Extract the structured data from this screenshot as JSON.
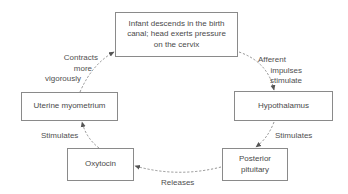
{
  "diagram": {
    "type": "cycle-flow",
    "nodes": {
      "stimulus": {
        "line1": "Infant descends in the birth",
        "line2": "canal; head exerts pressure",
        "line3": "on the cervix"
      },
      "hypothalamus": {
        "label": "Hypothalamus"
      },
      "pituitary": {
        "line1": "Posterior",
        "line2": "pituitary"
      },
      "oxytocin": {
        "label": "Oxytocin"
      },
      "uterus": {
        "label": "Uterine myometrium"
      }
    },
    "edges": {
      "afferent": {
        "line1": "Afferent",
        "line2": "impulses",
        "line3": "stimulate"
      },
      "hypo_to_pit": {
        "label": "Stimulates"
      },
      "releases": {
        "label": "Releases"
      },
      "oxy_to_uterus": {
        "label": "Stimulates"
      },
      "contracts": {
        "line1": "Contracts",
        "line2": "more",
        "line3": "vigorously"
      }
    },
    "colors": {
      "border": "#8a8a8a",
      "text": "#4a4a4a",
      "arrow": "#7a7a7a"
    }
  }
}
